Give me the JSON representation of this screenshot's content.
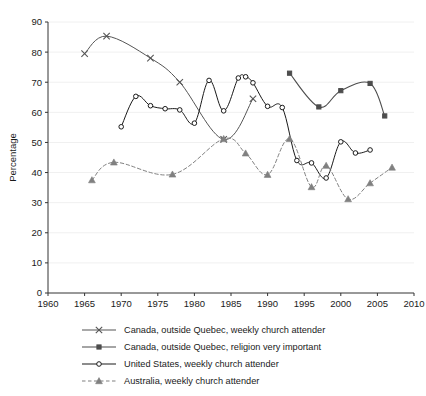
{
  "chart_data": {
    "type": "line",
    "title": "",
    "xlabel": "",
    "ylabel": "Percentage",
    "xlim": [
      1960,
      2010
    ],
    "ylim": [
      0,
      90
    ],
    "xticks": [
      1960,
      1965,
      1970,
      1975,
      1980,
      1985,
      1990,
      1995,
      2000,
      2005,
      2010
    ],
    "yticks": [
      0,
      10,
      20,
      30,
      40,
      50,
      60,
      70,
      80,
      90
    ],
    "grid": true,
    "legend_position": "below",
    "series": [
      {
        "name": "Canada, outside Quebec, weekly church attender",
        "marker": "x",
        "linestyle": "solid",
        "color": "#555555",
        "points": [
          [
            1965,
            79.5
          ],
          [
            1968,
            85.3
          ],
          [
            1974,
            78.0
          ],
          [
            1978,
            70.0
          ],
          [
            1984,
            51.0
          ],
          [
            1988,
            64.5
          ]
        ]
      },
      {
        "name": "Canada, outside Quebec, religion very important",
        "marker": "square",
        "linestyle": "solid",
        "color": "#4d4d4d",
        "points": [
          [
            1993,
            73.0
          ],
          [
            1997,
            61.8
          ],
          [
            2000,
            67.2
          ],
          [
            2004,
            69.6
          ],
          [
            2006,
            58.8
          ]
        ]
      },
      {
        "name": "United States, weekly church attender",
        "marker": "circle",
        "linestyle": "solid",
        "color": "#1a1a1a",
        "points": [
          [
            1970,
            55.2
          ],
          [
            1972,
            65.3
          ],
          [
            1974,
            62.2
          ],
          [
            1976,
            61.2
          ],
          [
            1978,
            60.8
          ],
          [
            1980,
            56.4
          ],
          [
            1982,
            70.6
          ],
          [
            1984,
            60.5
          ],
          [
            1986,
            71.4
          ],
          [
            1987,
            71.8
          ],
          [
            1988,
            69.8
          ],
          [
            1990,
            62.0
          ],
          [
            1992,
            61.6
          ],
          [
            1994,
            44.0
          ],
          [
            1996,
            43.2
          ],
          [
            1998,
            38.2
          ],
          [
            2000,
            50.2
          ],
          [
            2002,
            46.5
          ],
          [
            2004,
            47.5
          ]
        ]
      },
      {
        "name": "Australia, weekly church attender",
        "marker": "triangle",
        "linestyle": "dashed",
        "color": "#808080",
        "points": [
          [
            1966,
            37.5
          ],
          [
            1969,
            43.4
          ],
          [
            1977,
            39.4
          ],
          [
            1984,
            51.2
          ],
          [
            1987,
            46.4
          ],
          [
            1990,
            39.3
          ],
          [
            1993,
            51.2
          ],
          [
            1996,
            35.2
          ],
          [
            1998,
            42.3
          ],
          [
            2001,
            31.2
          ],
          [
            2004,
            36.5
          ],
          [
            2007,
            41.7
          ]
        ]
      }
    ]
  },
  "legend": {
    "entries": [
      {
        "label": "Canada, outside Quebec, weekly church attender",
        "marker": "x-marker",
        "linestyle": "solid"
      },
      {
        "label": "Canada, outside Quebec, religion very important",
        "marker": "square-marker",
        "linestyle": "solid"
      },
      {
        "label": "United States, weekly church attender",
        "marker": "circle-marker",
        "linestyle": "solid"
      },
      {
        "label": "Australia, weekly church attender",
        "marker": "triangle-marker",
        "linestyle": "dashed"
      }
    ]
  },
  "colors": {
    "x_series": "#555555",
    "square_series": "#4d4d4d",
    "circle_series": "#1a1a1a",
    "triangle_series": "#808080",
    "axis": "#333333",
    "grid": "#f0f0f0",
    "background": "#ffffff"
  }
}
